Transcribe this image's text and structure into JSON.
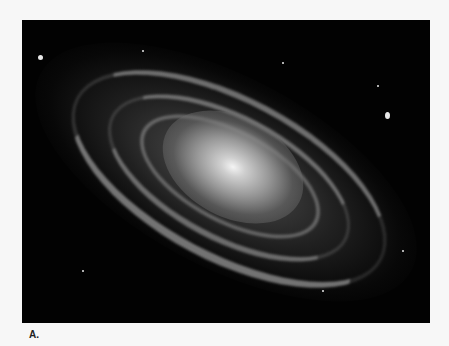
{
  "figure": {
    "label": "A.",
    "colors": {
      "background": "#f7f7f7",
      "image_bg": "#020202",
      "core": "#f4f4f4"
    }
  }
}
